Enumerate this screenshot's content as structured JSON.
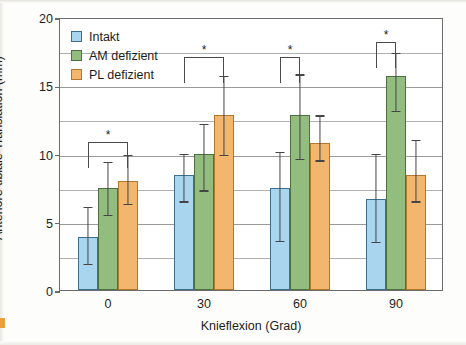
{
  "chart_data": {
    "type": "bar",
    "title": "",
    "xlabel": "Knieflexion (Grad)",
    "ylabel": "Anteriore tibiale Translation (mm)",
    "categories": [
      "0",
      "30",
      "60",
      "90"
    ],
    "ylim": [
      0,
      20
    ],
    "yticks": [
      0,
      5,
      10,
      15,
      20
    ],
    "ytick_labels": [
      "0",
      "5",
      "10",
      "15",
      "20"
    ],
    "minor_gridlines": [
      2.5,
      7.5,
      12.5,
      17.5
    ],
    "grid": true,
    "legend_position": "top-left",
    "series": [
      {
        "name": "Intakt",
        "color": "#a9d5ef",
        "values": [
          3.9,
          8.4,
          7.5,
          6.7
        ],
        "err_low": [
          2.0,
          6.6,
          3.7,
          3.6
        ],
        "err_high": [
          6.2,
          10.1,
          10.2,
          10.1
        ]
      },
      {
        "name": "AM defizient",
        "color": "#93bd7f",
        "values": [
          7.5,
          10.0,
          12.8,
          15.7
        ],
        "err_low": [
          5.6,
          7.4,
          9.7,
          13.2
        ],
        "err_high": [
          9.5,
          12.3,
          15.9,
          17.5
        ]
      },
      {
        "name": "PL defizient",
        "color": "#f2b66d",
        "values": [
          8.0,
          12.8,
          10.8,
          8.4
        ],
        "err_low": [
          6.4,
          10.0,
          9.6,
          6.6
        ],
        "err_high": [
          10.0,
          15.8,
          12.9,
          11.1
        ]
      }
    ],
    "annotations": [
      {
        "group": 0,
        "from_series": 0,
        "to_series": 2,
        "label": "*",
        "level": 11.0
      },
      {
        "group": 1,
        "from_series": 0,
        "to_series": 2,
        "label": "*",
        "level": 17.2
      },
      {
        "group": 2,
        "from_series": 0,
        "to_series": 1,
        "label": "*",
        "level": 17.2
      },
      {
        "group": 3,
        "from_series": 0,
        "to_series": 1,
        "label": "*",
        "level": 18.3
      }
    ]
  }
}
